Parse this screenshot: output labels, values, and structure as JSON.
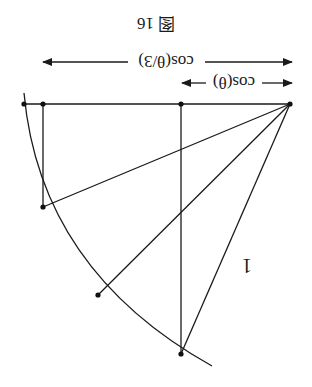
{
  "figure": {
    "caption": "图 16",
    "orientation": "rotated 180°",
    "labels": {
      "long_span": "cos(θ/3)",
      "short_span": "cos(θ)",
      "radius": "1"
    }
  },
  "colors": {
    "stroke": "#1a1a1a",
    "background": "#ffffff"
  }
}
